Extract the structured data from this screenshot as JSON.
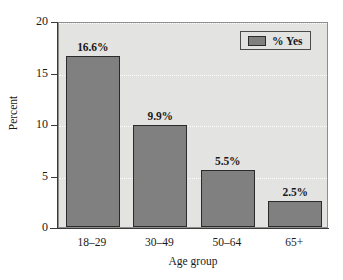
{
  "chart_data": {
    "type": "bar",
    "title": "",
    "categories": [
      "18–29",
      "30–49",
      "50–64",
      "65+"
    ],
    "values": [
      16.6,
      9.9,
      5.5,
      2.5
    ],
    "data_labels": [
      "16.6%",
      "9.9%",
      "5.5%",
      "2.5%"
    ],
    "series": [
      {
        "name": "% Yes",
        "values": [
          16.6,
          9.9,
          5.5,
          2.5
        ],
        "color": "#808080"
      }
    ],
    "xlabel": "Age group",
    "ylabel": "Percent",
    "ylim": [
      0,
      20
    ],
    "yticks": [
      0,
      5,
      10,
      15,
      20
    ],
    "ytick_labels": [
      "0",
      "5",
      "10",
      "15",
      "20"
    ],
    "grid": true,
    "grid_axis": "y",
    "grid_style": "dotted",
    "grid_color": "#ffffff",
    "legend": {
      "position": "top-right",
      "entries": [
        {
          "label": "% Yes",
          "color": "#808080"
        }
      ]
    },
    "plot_background": "#e3e3e1",
    "bar_edge_color": "#2b2b2b",
    "axis_color": "#3a3a3a"
  },
  "axes": {
    "y_title": "Percent",
    "x_title": "Age group"
  },
  "legend": {
    "swatch_name": "legend-swatch",
    "label": "% Yes"
  }
}
